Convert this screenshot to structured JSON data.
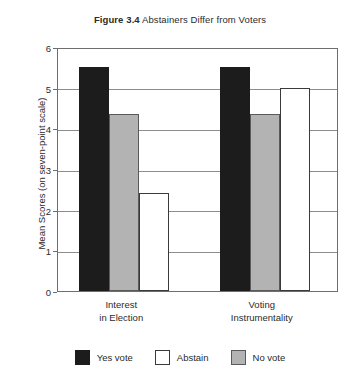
{
  "chart_data": {
    "type": "bar",
    "title_prefix": "Figure 3.4",
    "title_rest": " Abstainers Differ from Voters",
    "title": "Figure 3.4 Abstainers Differ from Voters",
    "xlabel": "",
    "ylabel": "Mean Scores (on seven-point scale)",
    "ylim": [
      0,
      6
    ],
    "yticks": [
      0,
      1,
      2,
      3,
      4,
      5,
      6
    ],
    "ytick_labels": [
      "0",
      "1",
      "2",
      "3",
      "4",
      "5",
      "6"
    ],
    "grid": true,
    "grid_axis": "y",
    "legend_position": "bottom",
    "categories": [
      "Interest in Election",
      "Voting Instrumentality"
    ],
    "category_lines": [
      [
        "Interest",
        "in Election"
      ],
      [
        "Voting",
        "Instrumentality"
      ]
    ],
    "bar_draw_order": [
      "Yes vote",
      "No vote",
      "Abstain"
    ],
    "series": [
      {
        "name": "Yes vote",
        "color": "#1c1c1c",
        "edge": "#1c1c1c",
        "values": [
          5.5,
          5.5
        ]
      },
      {
        "name": "No vote",
        "color": "#b3b3b3",
        "edge": "#5a5a5a",
        "values": [
          4.35,
          4.35
        ]
      },
      {
        "name": "Abstain",
        "color": "#ffffff",
        "edge": "#3a3a3a",
        "values": [
          2.4,
          5.0
        ]
      }
    ],
    "legend_entries": [
      {
        "label": "Yes vote",
        "swatch": "black"
      },
      {
        "label": "Abstain",
        "swatch": "white"
      },
      {
        "label": "No vote",
        "swatch": "gray"
      }
    ]
  }
}
